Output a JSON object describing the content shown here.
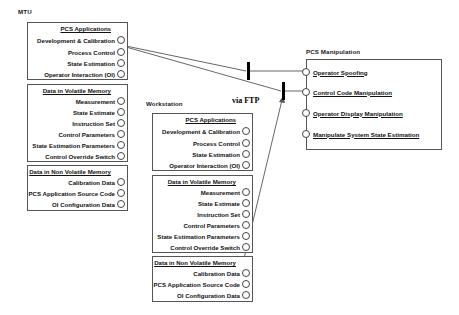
{
  "diagram": {
    "title_mtu": "MTU",
    "title_workstation": "Workstation",
    "title_pcs_manipulation": "PCS Manipulation",
    "ftp_label": "via FTP"
  },
  "mtu": {
    "label": "MTU",
    "panels": [
      {
        "title": "PCS Applications",
        "rows": [
          "Development  & Calibration",
          "Process   Control",
          "State Estimation",
          "Operator Interaction (OI)"
        ]
      },
      {
        "title": "Data in Volatile Memory",
        "rows": [
          "Measurement",
          "State Estimate",
          "Instruction  Set",
          "Control Parameters",
          "State Estimation  Parameters",
          "Control Override Switch"
        ]
      },
      {
        "title": "Data in Non Volatile Memory",
        "rows": [
          "Calibration Data",
          "PCS Application Source Code",
          "OI Configuration Data"
        ]
      }
    ]
  },
  "workstation": {
    "label": "Workstation",
    "panels": [
      {
        "title": "PCS Applications",
        "rows": [
          "Development  & Calibration",
          "Process   Control",
          "State Estimation",
          "Operator Interaction (OI)"
        ]
      },
      {
        "title": "Data in Volatile Memory",
        "rows": [
          "Measurement",
          "State Estimate",
          "Instruction  Set",
          "Control Parameters",
          "State Estimation  Parameters",
          "Control Override Switch"
        ]
      },
      {
        "title": "Data in Non Volatile Memory",
        "rows": [
          "Calibration Data",
          "PCS Application Source Code",
          "OI Configuration Data"
        ]
      }
    ]
  },
  "pcs_manipulation": {
    "label": "PCS Manipulation",
    "rows": [
      "Operator  Spoofing",
      "Control Code Manipulation",
      "Operator Display  Manipulation",
      "Manipulate System  State Estimation"
    ]
  },
  "colors": {
    "line": "#555555",
    "bar": "#000000",
    "text": "#111111",
    "panel_border": "#555555",
    "background": "#ffffff"
  }
}
